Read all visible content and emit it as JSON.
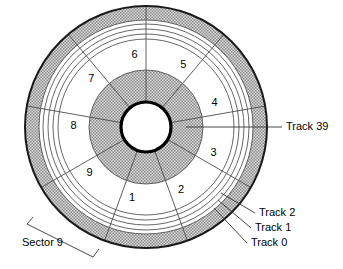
{
  "figure": {
    "kind": "disk-platter-track-sector-diagram",
    "geometry": {
      "center_x": 146,
      "center_y": 127,
      "outer_radius": 121,
      "shaded_band_inner_radius": 107,
      "track_ring_radii": [
        103,
        98,
        93,
        88
      ],
      "sector_band_inner_radius": 57,
      "inner_shaded_outer_radius": 57,
      "hub_radius": 25,
      "sector_count": 9,
      "sector_start_angle_deg": -90
    },
    "colors": {
      "outline": "#1a1a1a",
      "ring_line": "#555555",
      "sector_line": "#4d4d4d",
      "shade_fill": "#c9c9c9",
      "shade_dot": "#8a8a8a",
      "hub_fill": "#ffffff",
      "background": "#ffffff",
      "leader_line": "#333333"
    }
  },
  "sectors": [
    {
      "label": "1",
      "angle_deg": 101
    },
    {
      "label": "2",
      "angle_deg": 61
    },
    {
      "label": "3",
      "angle_deg": 21
    },
    {
      "label": "4",
      "angle_deg": -19
    },
    {
      "label": "5",
      "angle_deg": -59
    },
    {
      "label": "6",
      "angle_deg": -99
    },
    {
      "label": "7",
      "angle_deg": -139
    },
    {
      "label": "8",
      "angle_deg": -179
    },
    {
      "label": "9",
      "angle_deg": 141
    }
  ],
  "callouts": [
    {
      "id": "track-39",
      "label": "Track 39",
      "text_x": 286,
      "text_y": 127,
      "line_x1": 186,
      "line_y1": 127,
      "line_x2": 282,
      "line_y2": 127
    },
    {
      "id": "track-2",
      "label": "Track 2",
      "text_x": 259,
      "text_y": 213,
      "line_x1": 221,
      "line_y1": 193,
      "line_x2": 255,
      "line_y2": 213
    },
    {
      "id": "track-1",
      "label": "Track 1",
      "text_x": 255,
      "text_y": 228,
      "line_x1": 218,
      "line_y1": 200,
      "line_x2": 251,
      "line_y2": 228
    },
    {
      "id": "track-0",
      "label": "Track 0",
      "text_x": 251,
      "text_y": 243,
      "line_x1": 214,
      "line_y1": 208,
      "line_x2": 247,
      "line_y2": 243
    }
  ],
  "bracket": {
    "id": "sector-9",
    "label": "Sector 9",
    "text_x": 22,
    "text_y": 243,
    "path": "M 33 217 L 27 224 L 93 257 L 99 249"
  }
}
